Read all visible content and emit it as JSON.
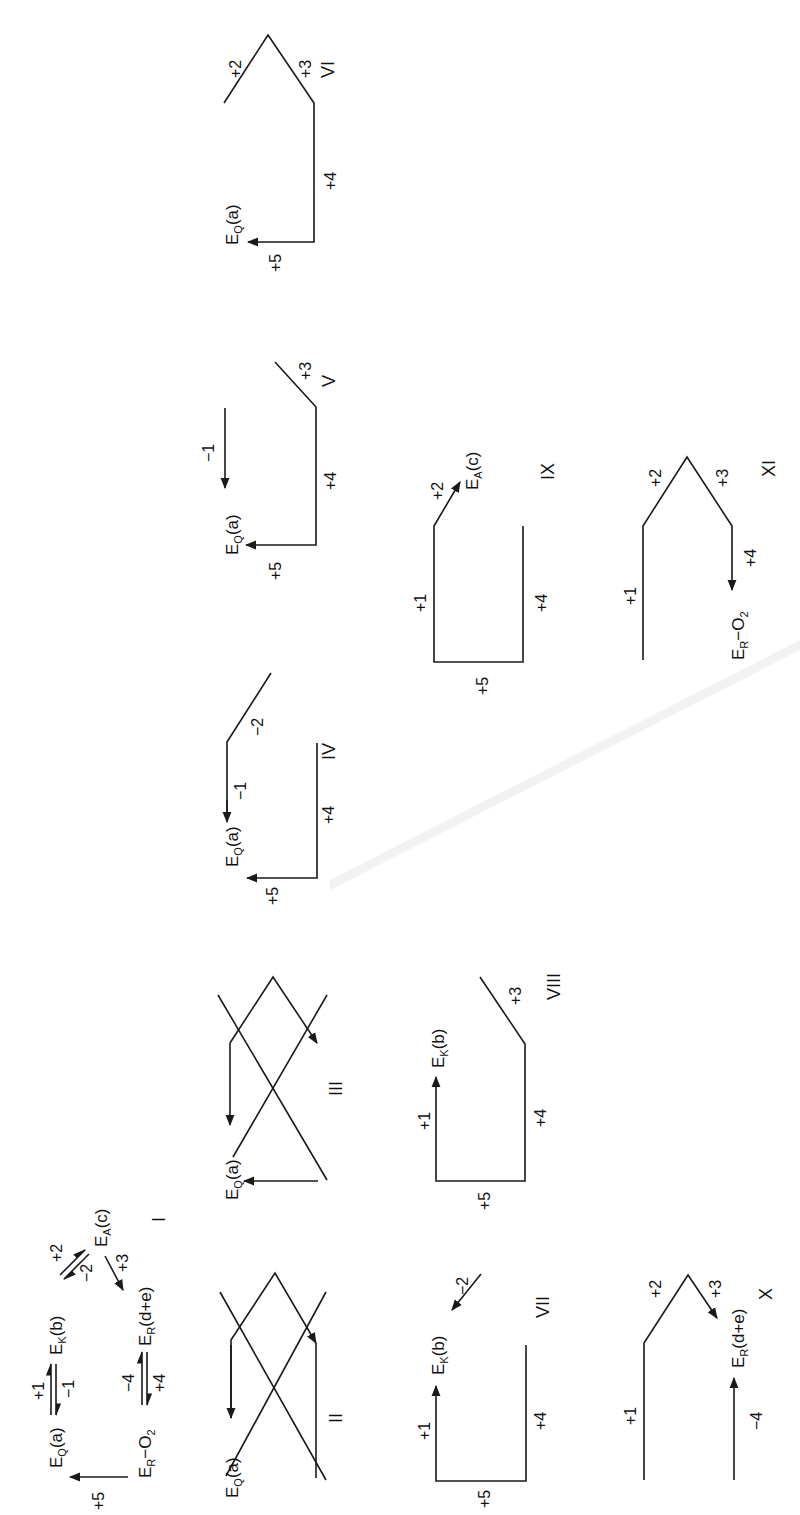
{
  "figure": {
    "orientation": "rotated 90 degrees counterclockwise",
    "ink_color": "#1a1a1a",
    "background": "#ffffff"
  },
  "scheme": {
    "panel_label": "I",
    "species": {
      "EQ": {
        "base": "E",
        "sub": "Q",
        "suffix": "(a)"
      },
      "EK": {
        "base": "E",
        "sub": "K",
        "suffix": "(b)"
      },
      "EA": {
        "base": "E",
        "sub": "A",
        "suffix": "(c)"
      },
      "ER": {
        "base": "E",
        "sub": "R",
        "suffix": "(d+e)"
      },
      "ERO2": {
        "base": "E",
        "sub": "R",
        "suffix": "−O",
        "suffix_sub": "2"
      }
    },
    "steps": {
      "p1": "+1",
      "m1": "−1",
      "p2": "+2",
      "m2": "−2",
      "p3": "+3",
      "p4": "+4",
      "m4": "−4",
      "p5": "+5"
    }
  },
  "panels": [
    {
      "label": "II"
    },
    {
      "label": "III"
    },
    {
      "label": "IV",
      "steps": [
        "−1",
        "−2",
        "+4",
        "+5"
      ]
    },
    {
      "label": "V",
      "steps": [
        "−1",
        "+3",
        "+4",
        "+5"
      ]
    },
    {
      "label": "VI",
      "steps": [
        "+2",
        "+3",
        "+4",
        "+5"
      ]
    },
    {
      "label": "VII",
      "steps": [
        "+1",
        "−2",
        "+4",
        "+5"
      ]
    },
    {
      "label": "VIII",
      "steps": [
        "+1",
        "+3",
        "+4",
        "+5"
      ]
    },
    {
      "label": "IX",
      "steps": [
        "+1",
        "+2",
        "+4",
        "+5"
      ]
    },
    {
      "label": "X",
      "steps": [
        "+1",
        "+2",
        "+3",
        "−4"
      ]
    },
    {
      "label": "XI",
      "steps": [
        "+1",
        "+2",
        "+3",
        "+4"
      ]
    }
  ]
}
